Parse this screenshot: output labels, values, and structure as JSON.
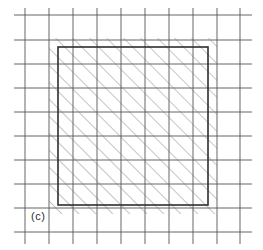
{
  "figure": {
    "panel_label": "(c)",
    "label_position": {
      "x": 31,
      "y": 210
    },
    "canvas": {
      "width": 263,
      "height": 250
    },
    "background_color": "#ffffff",
    "grid": {
      "line_color": "#555555",
      "line_width": 0.9,
      "vertical_x": [
        25,
        49,
        73,
        97,
        121,
        145,
        169,
        193,
        217,
        240
      ],
      "horizontal_y": [
        15,
        40,
        64,
        88,
        112,
        136,
        160,
        184,
        208,
        232
      ],
      "vertical_extent": {
        "y_start": 8,
        "y_end": 244
      },
      "horizontal_extent": {
        "x_start": 14,
        "x_end": 252
      },
      "spacing_px": 24
    },
    "region": {
      "shape": "square",
      "outline_color": "#2e2e2e",
      "outline_width": 1.6,
      "fill": "none",
      "x": 58,
      "y": 47,
      "width": 150,
      "height": 158
    },
    "hatching": {
      "angle_deg": 45,
      "direction": "lower-left-to-upper-right",
      "line_color": "#6e6e6e",
      "line_width": 0.8,
      "spacing_px": 12,
      "overhang_px": 9,
      "x": 49,
      "y": 38,
      "width": 168,
      "height": 176
    }
  }
}
